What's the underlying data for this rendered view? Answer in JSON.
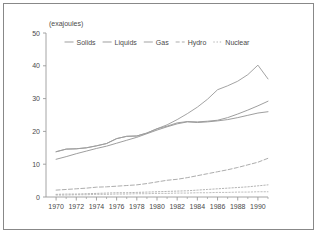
{
  "figure": {
    "axis_title": "(exajoules)",
    "frame_color": "#888888",
    "axis_color": "#9a9a9a",
    "text_color": "#4a4a4a"
  },
  "chart_data": {
    "type": "line",
    "title": "",
    "subtitle": "",
    "xlabel": "",
    "ylabel": "(exajoules)",
    "xlim": [
      1969,
      1991
    ],
    "ylim": [
      0,
      50
    ],
    "yticks": [
      0,
      10,
      20,
      30,
      40,
      50
    ],
    "ytick_labels": [
      "0",
      "10",
      "20",
      "30",
      "40",
      "50"
    ],
    "xticks": [
      1970,
      1972,
      1974,
      1976,
      1978,
      1980,
      1982,
      1984,
      1986,
      1988,
      1990
    ],
    "xtick_labels": [
      "1970",
      "1972",
      "1974",
      "1976",
      "1978",
      "1980",
      "1982",
      "1984",
      "1986",
      "1988",
      "1990"
    ],
    "minor_xticks": true,
    "grid": false,
    "legend_position": "top-center",
    "x": [
      1970,
      1971,
      1972,
      1973,
      1974,
      1975,
      1976,
      1977,
      1978,
      1979,
      1980,
      1981,
      1982,
      1983,
      1984,
      1985,
      1986,
      1987,
      1988,
      1989,
      1990,
      1991
    ],
    "series": [
      {
        "name": "Solids",
        "style": "solid",
        "color": "#999999",
        "values": [
          13.8,
          14.6,
          14.7,
          15.0,
          15.6,
          16.3,
          17.8,
          18.5,
          18.6,
          19.5,
          20.8,
          21.6,
          22.6,
          23.0,
          22.9,
          23.1,
          23.4,
          24.2,
          25.3,
          26.5,
          27.8,
          29.2
        ]
      },
      {
        "name": "Liquids",
        "style": "solid",
        "color": "#999999",
        "values": [
          11.5,
          12.3,
          13.2,
          14.0,
          14.8,
          15.5,
          16.4,
          17.3,
          18.2,
          19.3,
          20.4,
          21.4,
          22.3,
          22.9,
          22.7,
          22.9,
          23.2,
          23.6,
          24.2,
          24.9,
          25.6,
          26.0
        ]
      },
      {
        "name": "Gas",
        "style": "solid",
        "color": "#9e9e9e",
        "values": [
          13.8,
          14.6,
          14.7,
          15.0,
          15.6,
          16.3,
          17.8,
          18.5,
          18.6,
          19.5,
          20.8,
          22.0,
          23.6,
          25.4,
          27.4,
          29.8,
          32.7,
          33.9,
          35.3,
          37.3,
          40.2,
          36.0
        ]
      },
      {
        "name": "Hydro",
        "style": "dashed",
        "color": "#a8a8a8",
        "values": [
          2.1,
          2.3,
          2.5,
          2.7,
          3.0,
          3.1,
          3.3,
          3.5,
          3.7,
          4.1,
          4.6,
          5.1,
          5.4,
          5.9,
          6.5,
          7.1,
          7.7,
          8.3,
          9.0,
          9.8,
          10.6,
          11.8
        ]
      },
      {
        "name": "Nuclear",
        "style": "dotted",
        "color": "#b0b0b0",
        "values": [
          0.8,
          0.9,
          0.9,
          1.0,
          1.1,
          1.2,
          1.3,
          1.3,
          1.4,
          1.5,
          1.6,
          1.7,
          1.8,
          1.9,
          2.1,
          2.3,
          2.5,
          2.7,
          2.9,
          3.1,
          3.4,
          3.7
        ]
      }
    ],
    "secondary_lines": [
      {
        "name": "NuclearLow",
        "style": "dotted",
        "color": "#bbbbbb",
        "values": [
          0.6,
          0.6,
          0.7,
          0.7,
          0.8,
          0.8,
          0.9,
          0.9,
          1.0,
          1.0,
          1.1,
          1.1,
          1.2,
          1.2,
          1.3,
          1.3,
          1.4,
          1.4,
          1.5,
          1.5,
          1.6,
          1.6
        ]
      }
    ],
    "legend": [
      {
        "label": "Solids",
        "style": "solid",
        "color": "#999999"
      },
      {
        "label": "Liquids",
        "style": "solid",
        "color": "#999999"
      },
      {
        "label": "Gas",
        "style": "solid",
        "color": "#9e9e9e"
      },
      {
        "label": "Hydro",
        "style": "dashed",
        "color": "#a8a8a8"
      },
      {
        "label": "Nuclear",
        "style": "dotted",
        "color": "#b0b0b0"
      }
    ]
  }
}
